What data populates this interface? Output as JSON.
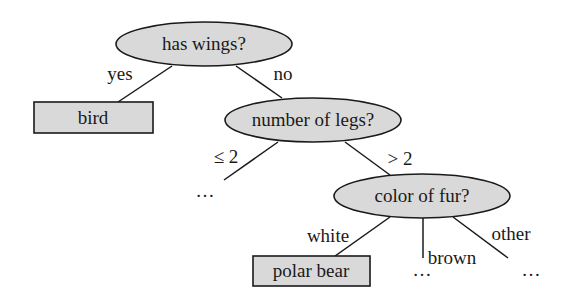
{
  "diagram": {
    "type": "decision-tree",
    "colors": {
      "node_fill": "#d9d9d9",
      "stroke": "#1a1a1a",
      "background": "#ffffff"
    },
    "nodes": {
      "root": {
        "label": "has wings?",
        "shape": "ellipse"
      },
      "bird": {
        "label": "bird",
        "shape": "box"
      },
      "legs": {
        "label": "number of legs?",
        "shape": "ellipse"
      },
      "fur": {
        "label": "color of fur?",
        "shape": "ellipse"
      },
      "polar_bear": {
        "label": "polar bear",
        "shape": "box"
      },
      "legs_le2_cont": {
        "label": "…"
      },
      "fur_brown_cont": {
        "label": "…"
      },
      "fur_other_cont": {
        "label": "…"
      }
    },
    "edges": {
      "root_bird": {
        "label": "yes"
      },
      "root_legs": {
        "label": "no"
      },
      "legs_le2": {
        "label": "≤ 2"
      },
      "legs_gt2": {
        "label": "> 2"
      },
      "fur_white": {
        "label": "white"
      },
      "fur_brown": {
        "label": "brown"
      },
      "fur_other": {
        "label": "other"
      }
    }
  }
}
